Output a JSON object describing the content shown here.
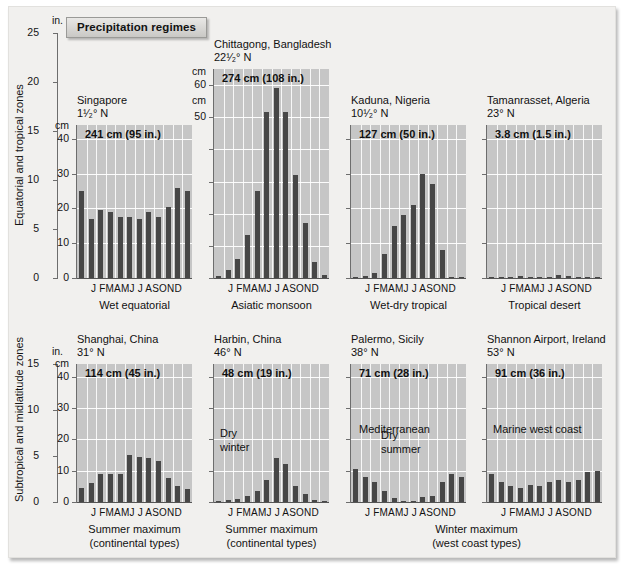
{
  "figure": {
    "banner": "Precipitation regimes",
    "row_labels": {
      "top": "Equatorial and tropical zones",
      "bottom": "Subtropical and midlatitude zones"
    },
    "unit_inches": "in.",
    "unit_cm": "cm",
    "months": "J FMAMJ J ASOND",
    "month_list": [
      "J",
      "F",
      "M",
      "A",
      "M",
      "J",
      "J",
      "A",
      "S",
      "O",
      "N",
      "D"
    ]
  },
  "axes": {
    "top_inches": {
      "ticks": [
        0,
        5,
        10,
        15,
        20,
        25
      ],
      "max": 25
    },
    "bottom_inches": {
      "ticks": [
        0,
        5,
        10,
        15
      ],
      "max": 15
    }
  },
  "chart_data": [
    {
      "type": "bar",
      "title": "Singapore",
      "latitude": "1¹⁄₂° N",
      "total": "241 cm (95 in.)",
      "regime": "Wet equatorial",
      "row": "top",
      "categories": [
        "J",
        "F",
        "M",
        "A",
        "M",
        "J",
        "J",
        "A",
        "S",
        "O",
        "N",
        "D"
      ],
      "values": [
        25,
        17,
        19.5,
        19,
        17.5,
        17.5,
        17,
        19,
        17.5,
        20.5,
        26,
        25
      ],
      "ylabel": "cm",
      "ylim": [
        0,
        44
      ],
      "yticks": [
        0,
        10,
        20,
        30,
        40
      ],
      "ytick_labels": [
        "0",
        "10",
        "20",
        "30",
        "40"
      ],
      "note": "",
      "grid": true
    },
    {
      "type": "bar",
      "title": "Chittagong, Bangladesh",
      "latitude": "22¹⁄₂° N",
      "total": "274 cm (108 in.)",
      "regime": "Asiatic monsoon",
      "row": "top",
      "categories": [
        "J",
        "F",
        "M",
        "A",
        "M",
        "J",
        "J",
        "A",
        "S",
        "O",
        "N",
        "D"
      ],
      "values": [
        0.5,
        2.5,
        6,
        13.5,
        27,
        51.5,
        59,
        51.5,
        32,
        17,
        5,
        1
      ],
      "ylabel": "cm",
      "ylim": [
        0,
        65
      ],
      "yticks": [
        0,
        10,
        20,
        30,
        40,
        50,
        60
      ],
      "ytick_labels": [
        "",
        "",
        "",
        "",
        "",
        "50",
        "60"
      ],
      "note": "",
      "grid": true
    },
    {
      "type": "bar",
      "title": "Kaduna, Nigeria",
      "latitude": "10¹⁄₂° N",
      "total": "127 cm (50 in.)",
      "regime": "Wet-dry tropical",
      "row": "top",
      "categories": [
        "J",
        "F",
        "M",
        "A",
        "M",
        "J",
        "J",
        "A",
        "S",
        "O",
        "N",
        "D"
      ],
      "values": [
        0.3,
        0.5,
        1.5,
        7,
        15,
        18,
        21,
        30,
        27,
        8,
        0.4,
        0.3
      ],
      "ylabel": "",
      "ylim": [
        0,
        44
      ],
      "yticks": [
        0,
        10,
        20,
        30,
        40
      ],
      "ytick_labels": [
        "",
        "",
        "",
        "",
        ""
      ],
      "note": "",
      "grid": true
    },
    {
      "type": "bar",
      "title": "Tamanrasset, Algeria",
      "latitude": "23° N",
      "total": "3.8 cm (1.5 in.)",
      "regime": "Tropical desert",
      "row": "top",
      "categories": [
        "J",
        "F",
        "M",
        "A",
        "M",
        "J",
        "J",
        "A",
        "S",
        "O",
        "N",
        "D"
      ],
      "values": [
        0.3,
        0.3,
        0.4,
        0.5,
        0.4,
        0.3,
        0.2,
        0.8,
        0.6,
        0.3,
        0.3,
        0.3
      ],
      "ylabel": "",
      "ylim": [
        0,
        44
      ],
      "yticks": [
        0,
        10,
        20,
        30,
        40
      ],
      "ytick_labels": [
        "",
        "",
        "",
        "",
        ""
      ],
      "note": "",
      "grid": true
    },
    {
      "type": "bar",
      "title": "Shanghai, China",
      "latitude": "31° N",
      "total": "114 cm (45 in.)",
      "regime": "Summer maximum\n(continental types)",
      "row": "bottom",
      "categories": [
        "J",
        "F",
        "M",
        "A",
        "M",
        "J",
        "J",
        "A",
        "S",
        "O",
        "N",
        "D"
      ],
      "values": [
        4.5,
        6,
        9,
        9,
        9,
        15,
        14.5,
        14,
        13,
        7.5,
        5,
        4
      ],
      "ylabel": "cm",
      "ylim": [
        0,
        44
      ],
      "yticks": [
        0,
        10,
        20,
        30,
        40
      ],
      "ytick_labels": [
        "0",
        "10",
        "20",
        "30",
        "40"
      ],
      "note": "",
      "grid": true
    },
    {
      "type": "bar",
      "title": "Harbin, China",
      "latitude": "46° N",
      "total": "48 cm (19 in.)",
      "regime": "Summer maximum\n(continental types)",
      "row": "bottom",
      "categories": [
        "J",
        "F",
        "M",
        "A",
        "M",
        "J",
        "J",
        "A",
        "S",
        "O",
        "N",
        "D"
      ],
      "values": [
        0.4,
        0.5,
        1,
        2,
        3.5,
        7,
        14,
        12,
        5,
        2.5,
        0.6,
        0.4
      ],
      "ylabel": "",
      "ylim": [
        0,
        44
      ],
      "yticks": [
        0,
        10,
        20,
        30,
        40
      ],
      "ytick_labels": [
        "",
        "",
        "",
        "",
        ""
      ],
      "note": "Dry\nwinter",
      "grid": true
    },
    {
      "type": "bar",
      "title": "Palermo, Sicily",
      "latitude": "38° N",
      "total": "71 cm (28 in.)",
      "regime": "Winter maximum\n(west coast types)",
      "row": "bottom",
      "categories": [
        "J",
        "F",
        "M",
        "A",
        "M",
        "J",
        "J",
        "A",
        "S",
        "O",
        "N",
        "D"
      ],
      "values": [
        10.5,
        8,
        6.5,
        3.5,
        1.2,
        0.4,
        0.3,
        1.5,
        2,
        6.5,
        9,
        8
      ],
      "ylabel": "",
      "ylim": [
        0,
        44
      ],
      "yticks": [
        0,
        10,
        20,
        30,
        40
      ],
      "ytick_labels": [
        "",
        "",
        "",
        "",
        ""
      ],
      "note": "Mediterranean",
      "note2": "Dry\nsummer",
      "grid": true
    },
    {
      "type": "bar",
      "title": "Shannon Airport, Ireland",
      "latitude": "53° N",
      "total": "91 cm (36 in.)",
      "regime": "Winter maximum\n(west coast types)",
      "row": "bottom",
      "categories": [
        "J",
        "F",
        "M",
        "A",
        "M",
        "J",
        "J",
        "A",
        "S",
        "O",
        "N",
        "D"
      ],
      "values": [
        9,
        6.5,
        5,
        4.5,
        5.5,
        5,
        6.5,
        7,
        6.5,
        7,
        9.5,
        10
      ],
      "ylabel": "",
      "ylim": [
        0,
        44
      ],
      "yticks": [
        0,
        10,
        20,
        30,
        40
      ],
      "ytick_labels": [
        "",
        "",
        "",
        "",
        ""
      ],
      "note": "Marine west coast",
      "grid": true
    }
  ],
  "shared_captions": {
    "top": [
      "Wet equatorial",
      "Asiatic monsoon",
      "Wet-dry tropical",
      "Tropical desert"
    ],
    "bottom_left": "Summer maximum\n(continental types)",
    "bottom_right": "Winter maximum\n(west coast types)"
  },
  "colors": {
    "bar": "#474747",
    "plot_background": "#c6c6c6",
    "grid": "#ffffff",
    "page": "#f1f0ee"
  }
}
